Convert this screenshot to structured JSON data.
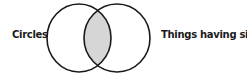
{
  "diagram": {
    "type": "venn",
    "sets": [
      {
        "label": "Circles"
      },
      {
        "label": "Things having sides"
      }
    ],
    "intersection_fill": "#d6d6d6",
    "stroke_color": "#1a1a1a"
  }
}
